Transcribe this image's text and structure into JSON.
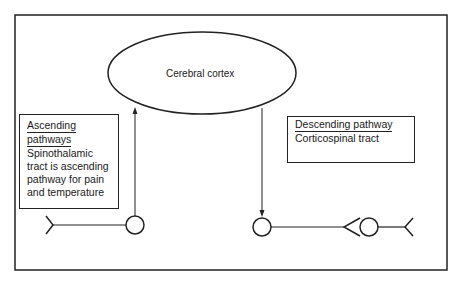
{
  "diagram": {
    "type": "neural pathway diagram",
    "center_node": {
      "label": "Cerebral cortex",
      "shape": "ellipse"
    },
    "ascending_box": {
      "title_line1": "Ascending",
      "title_line2": "pathways",
      "body_lines": [
        "Spinothalamic",
        "tract is ascending",
        "pathway for pain",
        "and temperature"
      ]
    },
    "descending_box": {
      "title": "Descending pathway",
      "body": "Corticospinal tract"
    },
    "edges": [
      {
        "from": "left-neuron",
        "to": "Cerebral cortex",
        "direction": "up",
        "label": "ascending"
      },
      {
        "from": "Cerebral cortex",
        "to": "right-neuron",
        "direction": "down",
        "label": "descending"
      }
    ],
    "colors": {
      "stroke": "#222222",
      "background": "#ffffff",
      "text": "#1a1a1a"
    }
  }
}
